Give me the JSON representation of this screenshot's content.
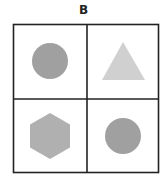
{
  "title": "B",
  "grid": {
    "rows": 2,
    "cols": 2,
    "cells": [
      {
        "position": "top-left",
        "shape": "circle",
        "color": "#a0a0a0"
      },
      {
        "position": "top-right",
        "shape": "triangle",
        "color": "#d0d0d0"
      },
      {
        "position": "bottom-left",
        "shape": "hexagon",
        "color": "#b0b0b0"
      },
      {
        "position": "bottom-right",
        "shape": "circle",
        "color": "#a0a0a0"
      }
    ]
  }
}
